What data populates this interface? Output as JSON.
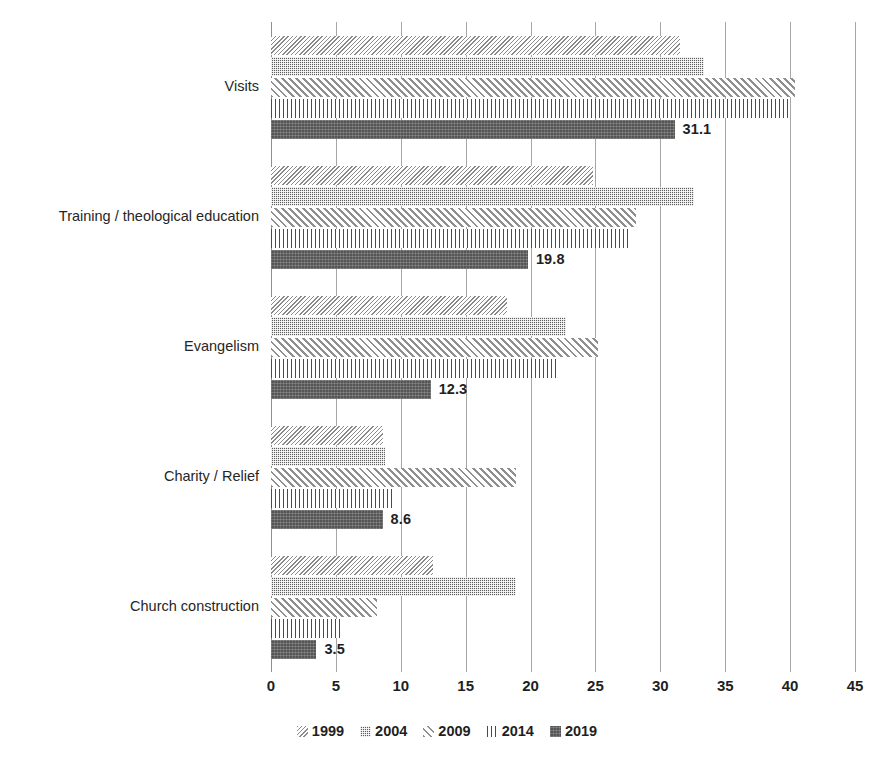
{
  "chart_data": {
    "type": "bar",
    "orientation": "horizontal",
    "title": "",
    "subtitle": "",
    "xlabel": "",
    "ylabel": "",
    "xlim": [
      0,
      45
    ],
    "xticks": [
      0,
      5,
      10,
      15,
      20,
      25,
      30,
      35,
      40,
      45
    ],
    "xtick_labels": [
      "0",
      "5",
      "10",
      "15",
      "20",
      "25",
      "30",
      "35",
      "40",
      "45"
    ],
    "grid": true,
    "grid_axis": "x",
    "legend_position": "bottom",
    "categories": [
      "Visits",
      "Training / theological education",
      "Evangelism",
      "Charity / Relief",
      "Church construction"
    ],
    "series": [
      {
        "name": "1999",
        "pattern": "fine-backward-diagonal",
        "color": "#8a8a8a",
        "values": [
          31.5,
          24.8,
          18.2,
          8.6,
          12.5
        ]
      },
      {
        "name": "2004",
        "pattern": "checkerboard",
        "color": "#5e5e5e",
        "values": [
          33.4,
          32.6,
          22.7,
          8.8,
          18.9
        ]
      },
      {
        "name": "2009",
        "pattern": "forward-diagonal",
        "color": "#8f8f8f",
        "values": [
          40.4,
          28.1,
          25.2,
          18.9,
          8.2
        ]
      },
      {
        "name": "2014",
        "pattern": "cross-hatch",
        "color": "#4a4a4a",
        "values": [
          40.0,
          27.5,
          22.2,
          9.4,
          5.3
        ]
      },
      {
        "name": "2019",
        "pattern": "solid",
        "color": "#555555",
        "values": [
          31.1,
          19.8,
          12.3,
          8.6,
          3.5
        ]
      }
    ],
    "data_labels": {
      "series": "2019",
      "values": [
        "31.1",
        "19.8",
        "12.3",
        "8.6",
        "3.5"
      ]
    }
  },
  "legend": {
    "items": [
      {
        "label": "1999",
        "swatch": "hatch-1999-swatch"
      },
      {
        "label": "2004",
        "swatch": "hatch-2004-swatch"
      },
      {
        "label": "2009",
        "swatch": "hatch-2009-swatch"
      },
      {
        "label": "2014",
        "swatch": "hatch-2014-swatch"
      },
      {
        "label": "2019",
        "swatch": "hatch-2019-swatch"
      }
    ]
  },
  "axis": {
    "x_tick_labels": [
      "0",
      "5",
      "10",
      "15",
      "20",
      "25",
      "30",
      "35",
      "40",
      "45"
    ],
    "y_category_labels": [
      "Visits",
      "Training / theological education",
      "Evangelism",
      "Charity / Relief",
      "Church construction"
    ]
  },
  "colors": {
    "gridline": "#a6a6a6",
    "axis_line": "#8f8f8f",
    "text": "#1f1f1f",
    "background": "#ffffff"
  }
}
